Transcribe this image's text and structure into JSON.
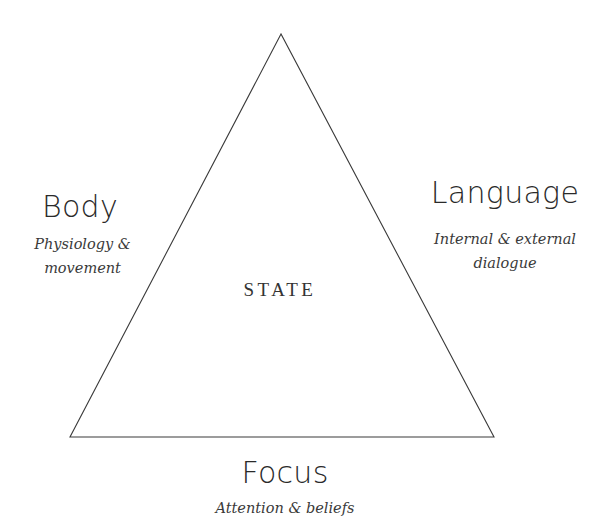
{
  "diagram": {
    "center_label": "STATE",
    "vertices": {
      "body": {
        "title": "Body",
        "subtitle_line1": "Physiology &",
        "subtitle_line2": "movement"
      },
      "language": {
        "title": "Language",
        "subtitle_line1": "Internal & external",
        "subtitle_line2": "dialogue"
      },
      "focus": {
        "title": "Focus",
        "subtitle_line1": "Attention & beliefs"
      }
    },
    "colors": {
      "line": "#3a3a3a",
      "text": "#2a2a2a",
      "background": "#ffffff"
    }
  }
}
